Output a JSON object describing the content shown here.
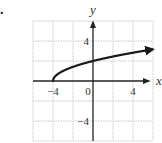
{
  "problem_marker": ".",
  "chart_data": {
    "type": "line",
    "title": "",
    "function": "y = sqrt(x + 4)",
    "xlabel": "x",
    "ylabel": "y",
    "xlim": [
      -6,
      6
    ],
    "ylim": [
      -6,
      6
    ],
    "grid": true,
    "grid_step": 2,
    "x_tick_labels": [
      {
        "value": -4,
        "label": "−4"
      },
      {
        "value": 0,
        "label": "0"
      },
      {
        "value": 4,
        "label": "4"
      }
    ],
    "y_tick_labels": [
      {
        "value": 4,
        "label": "4"
      },
      {
        "value": -4,
        "label": "−4"
      }
    ],
    "series": [
      {
        "name": "f(x)",
        "start_point": [
          -4,
          0
        ],
        "endpoint_arrow": true,
        "x": [
          -4,
          -3.9,
          -3.5,
          -3,
          -2,
          -1,
          0,
          1,
          2,
          3,
          4,
          5,
          5.9
        ],
        "y": [
          0,
          0.32,
          0.71,
          1,
          1.41,
          1.73,
          2,
          2.24,
          2.45,
          2.65,
          2.83,
          3,
          3.15
        ]
      }
    ],
    "legend": null
  },
  "colors": {
    "grid": "#c8c8c8",
    "axis": "#222222",
    "curve": "#1a1a1a",
    "text": "#333333"
  }
}
